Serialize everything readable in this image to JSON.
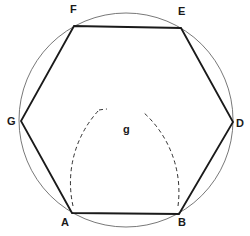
{
  "diagram": {
    "type": "geometric-construction",
    "shape": "regular hexagon inscribed in circle",
    "colors": {
      "stroke": "#1a1a1a",
      "circle": "#555555",
      "background": "#ffffff"
    },
    "circle": {
      "cx": 126,
      "cy": 120,
      "r": 107
    },
    "vertices": [
      {
        "label": "A",
        "x": 72,
        "y": 213
      },
      {
        "label": "B",
        "x": 179,
        "y": 214
      },
      {
        "label": "D",
        "x": 233,
        "y": 122
      },
      {
        "label": "E",
        "x": 181,
        "y": 28
      },
      {
        "label": "F",
        "x": 74,
        "y": 26
      },
      {
        "label": "G",
        "x": 21,
        "y": 121
      }
    ],
    "arc_intersection": {
      "label": "g",
      "x": 126,
      "y": 120
    },
    "labels": {
      "A": "A",
      "B": "B",
      "D": "D",
      "E": "E",
      "F": "F",
      "G": "G",
      "g": "g"
    }
  }
}
